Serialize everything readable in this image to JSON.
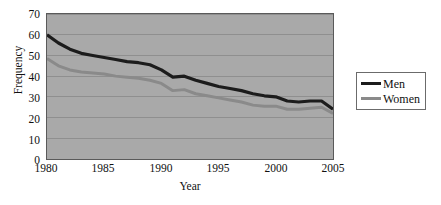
{
  "chart_data": {
    "type": "line",
    "title": "",
    "xlabel": "Year",
    "ylabel": "Frequency",
    "xlim": [
      1980,
      2005
    ],
    "ylim": [
      0,
      70
    ],
    "grid": "horizontal",
    "legend_position": "right",
    "xticks": [
      "1980",
      "1985",
      "1990",
      "1995",
      "2000",
      "2005"
    ],
    "yticks": [
      "0",
      "10",
      "20",
      "30",
      "40",
      "50",
      "60",
      "70"
    ],
    "x": [
      1980,
      1981,
      1982,
      1983,
      1984,
      1985,
      1986,
      1987,
      1988,
      1989,
      1990,
      1991,
      1992,
      1993,
      1994,
      1995,
      1996,
      1997,
      1998,
      1999,
      2000,
      2001,
      2002,
      2003,
      2004,
      2005
    ],
    "series": [
      {
        "name": "Men",
        "color": "#1c1c1c",
        "width": 3.2,
        "values": [
          60.0,
          56.0,
          53.0,
          51.0,
          50.0,
          49.0,
          48.0,
          47.0,
          46.5,
          45.5,
          43.0,
          39.5,
          40.0,
          38.0,
          36.5,
          35.0,
          34.0,
          33.0,
          31.5,
          30.5,
          30.0,
          28.0,
          27.5,
          28.0,
          28.0,
          24.0
        ]
      },
      {
        "name": "Women",
        "color": "#8a8a8a",
        "width": 3.0,
        "values": [
          48.5,
          45.0,
          43.0,
          42.0,
          41.5,
          41.0,
          40.0,
          39.5,
          39.0,
          38.0,
          36.5,
          33.0,
          33.5,
          31.5,
          30.5,
          29.5,
          28.5,
          27.5,
          26.0,
          25.5,
          25.5,
          24.0,
          24.0,
          24.5,
          25.0,
          22.0
        ]
      }
    ]
  },
  "legend": {
    "items": [
      {
        "label": "Men"
      },
      {
        "label": "Women"
      }
    ]
  },
  "colors": {
    "plot_background": "#a9a9a9",
    "frame": "#5a5a5a",
    "gridline": "#8f8f8f",
    "men": "#1c1c1c",
    "women": "#8a8a8a",
    "page_background": "#ffffff"
  }
}
